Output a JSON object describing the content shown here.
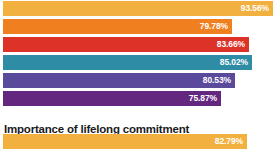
{
  "chart_data": {
    "type": "bar",
    "orientation": "horizontal",
    "title": "",
    "xlabel": "",
    "ylabel": "",
    "grid": false,
    "legend": false,
    "axis_visible": false,
    "value_label_position": "inside-end",
    "xlim": [
      0,
      100
    ],
    "categories": [
      "",
      "",
      "",
      "",
      "",
      "",
      ""
    ],
    "values": [
      93.56,
      79.78,
      83.66,
      85.02,
      80.53,
      75.87,
      82.79
    ],
    "value_labels": [
      "93.56%",
      "79.78%",
      "83.66%",
      "85.02%",
      "80.53%",
      "75.87%",
      "82.79%"
    ],
    "colors": [
      "#f2b13e",
      "#ef7f1f",
      "#dc3227",
      "#2e8ca5",
      "#5b4a9c",
      "#63277f",
      "#f2b13e"
    ],
    "series": [
      {
        "name": "percentage",
        "values": [
          93.56,
          79.78,
          83.66,
          85.02,
          80.53,
          75.87,
          82.79
        ]
      }
    ]
  },
  "heading": {
    "text": "Importance of lifelong commitment"
  },
  "bars": [
    {
      "label": "93.56%",
      "value": 93.56,
      "color": "#f2b13e",
      "pixel_width": 270,
      "top": 0
    },
    {
      "label": "79.78%",
      "value": 79.78,
      "color": "#ef7f1f",
      "pixel_width": 229,
      "top": 18
    },
    {
      "label": "83.66%",
      "value": 83.66,
      "color": "#dc3227",
      "pixel_width": 246,
      "top": 36
    },
    {
      "label": "85.02%",
      "value": 85.02,
      "color": "#2e8ca5",
      "pixel_width": 249,
      "top": 54
    },
    {
      "label": "80.53%",
      "value": 80.53,
      "color": "#5b4a9c",
      "pixel_width": 232,
      "top": 72
    },
    {
      "label": "75.87%",
      "value": 75.87,
      "color": "#63277f",
      "pixel_width": 218,
      "top": 90
    }
  ],
  "bottom_bars": [
    {
      "label": "82.79%",
      "value": 82.79,
      "color": "#f2b13e",
      "pixel_width": 244,
      "top": 0
    }
  ],
  "layout": {
    "heading_top": 113,
    "bottom_group_top": 133
  }
}
